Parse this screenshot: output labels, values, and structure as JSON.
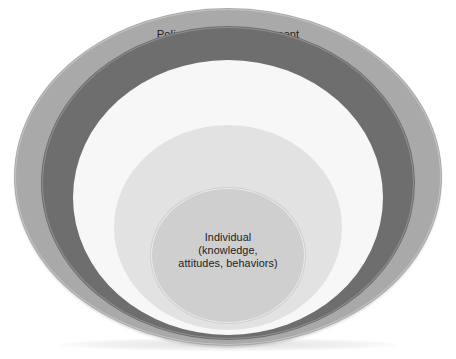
{
  "diagram": {
    "type": "nested-ellipses",
    "background_color": "#ffffff",
    "levels": [
      {
        "id": "policy",
        "heading": "Policy/enabling environment",
        "detail": "(national, state, local laws)",
        "text": "Policy/enabling environment\n(national, state, local laws)",
        "fill_color": "#a9a9a9",
        "text_color": "#1c1c1c",
        "order": 1
      },
      {
        "id": "organizational",
        "heading": "Organizational",
        "detail": "(organizations and social institutions)",
        "text": "Organizational\n(organizations and\nsocial institutions)",
        "fill_color": "#6e6e6e",
        "text_color": "#f2f2f2",
        "order": 2
      },
      {
        "id": "community",
        "heading": "Community",
        "detail": "(relationships between organizations)",
        "text": "Community\n(relationships between\norganizations)",
        "fill_color": "#f7f7f7",
        "text_color": "#1c1c1c",
        "order": 3
      },
      {
        "id": "interpersonal",
        "heading": "Interpersonal",
        "detail": "(families, friends, social networks)",
        "text": "Interpersonal\n(families, friends,\nsocial networks)",
        "fill_color": "#e2e2e2",
        "text_color": "#1c1c1c",
        "order": 4
      },
      {
        "id": "individual",
        "heading": "Individual",
        "detail": "(knowledge, attitudes, behaviors)",
        "text": "Individual\n(knowledge,\nattitudes, behaviors)",
        "fill_color": "#cfcfcf",
        "text_color": "#1c1c1c",
        "order": 5
      }
    ]
  }
}
